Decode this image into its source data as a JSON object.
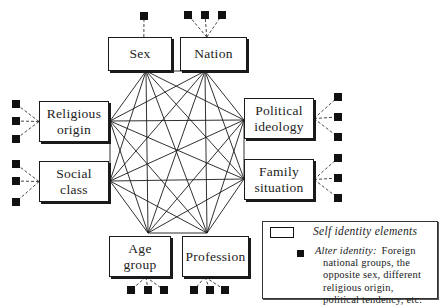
{
  "diagram": {
    "self_elements": [
      {
        "id": "sex",
        "label": "Sex",
        "lines": [
          "Sex"
        ],
        "box": [
          108,
          37,
          64,
          34
        ],
        "anchor": [
          146,
          71
        ],
        "alters": [
          [
            144,
            16
          ]
        ],
        "alter_side": "top"
      },
      {
        "id": "nation",
        "label": "Nation",
        "lines": [
          "Nation"
        ],
        "box": [
          180,
          37,
          67,
          34
        ],
        "anchor": [
          205,
          71
        ],
        "alters": [
          [
            188,
            15
          ],
          [
            205,
            15
          ],
          [
            222,
            15
          ]
        ],
        "alter_side": "top"
      },
      {
        "id": "religious-origin",
        "label": "Religious origin",
        "lines": [
          "Religious",
          "origin"
        ],
        "box": [
          39,
          101,
          70,
          41
        ],
        "anchor": [
          110,
          121
        ],
        "alters": [
          [
            16,
            104
          ],
          [
            16,
            121
          ],
          [
            16,
            139
          ]
        ],
        "alter_side": "left"
      },
      {
        "id": "social-class",
        "label": "Social class",
        "lines": [
          "Social",
          "class"
        ],
        "box": [
          39,
          161,
          70,
          41
        ],
        "anchor": [
          110,
          181
        ],
        "alters": [
          [
            16,
            164
          ],
          [
            16,
            181
          ],
          [
            16,
            202
          ]
        ],
        "alter_side": "left"
      },
      {
        "id": "political-ideology",
        "label": "Political ideology",
        "lines": [
          "Political",
          "ideology"
        ],
        "box": [
          244,
          98,
          70,
          41
        ],
        "anchor": [
          244,
          120
        ],
        "alters": [
          [
            338,
            97
          ],
          [
            338,
            117
          ],
          [
            338,
            137
          ]
        ],
        "alter_side": "right"
      },
      {
        "id": "family-situation",
        "label": "Family situation",
        "lines": [
          "Family",
          "situation"
        ],
        "box": [
          244,
          159,
          70,
          41
        ],
        "anchor": [
          244,
          179
        ],
        "alters": [
          [
            338,
            158
          ],
          [
            338,
            178
          ],
          [
            338,
            198
          ]
        ],
        "alter_side": "right"
      },
      {
        "id": "age-group",
        "label": "Age group",
        "lines": [
          "Age",
          "group"
        ],
        "box": [
          109,
          236,
          62,
          41
        ],
        "anchor": [
          148,
          233
        ],
        "alters": [
          [
            131,
            290
          ],
          [
            148,
            290
          ],
          [
            164,
            290
          ]
        ],
        "alter_side": "bottom"
      },
      {
        "id": "profession",
        "label": "Profession",
        "lines": [
          "Profession"
        ],
        "box": [
          182,
          236,
          67,
          41
        ],
        "anchor": [
          207,
          233
        ],
        "alters": [
          [
            194,
            290
          ],
          [
            210,
            290
          ],
          [
            225,
            290
          ]
        ],
        "alter_side": "bottom"
      }
    ],
    "connections": "complete-graph between all self identity elements",
    "alter_marker_color": "#111111",
    "line_color": "#1a1a1a"
  },
  "legend": {
    "self_label": "Self identity elements",
    "alter_title": "Alter identity:",
    "alter_first": "Foreign",
    "alter_lines": [
      "national groups, the",
      "opposite sex, different",
      "religious origin,",
      "political tendency, etc."
    ]
  }
}
